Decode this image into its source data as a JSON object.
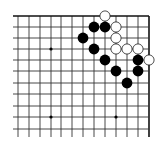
{
  "board": {
    "size": 19,
    "view": "top-right corner",
    "visible_columns": 13,
    "visible_rows": 11,
    "colors": {
      "background": "#ffffff",
      "line": "#333333",
      "edge_line": "#111111",
      "black_stone": "#000000",
      "white_stone": "#ffffff",
      "white_stone_outline": "#222222"
    },
    "columns_x": [
      149,
      138,
      127,
      116,
      105,
      94,
      83,
      72,
      61,
      51,
      40,
      29,
      18
    ],
    "rows_y": [
      16,
      27,
      38,
      49,
      60,
      71,
      83,
      94,
      106,
      117,
      129
    ],
    "star_points": [
      {
        "col": 3,
        "row": 3
      },
      {
        "col": 9,
        "row": 3
      },
      {
        "col": 3,
        "row": 9
      },
      {
        "col": 9,
        "row": 9
      }
    ],
    "stones": [
      {
        "color": "white",
        "col": 4,
        "row": 0
      },
      {
        "color": "black",
        "col": 5,
        "row": 1
      },
      {
        "color": "black",
        "col": 4,
        "row": 1
      },
      {
        "color": "white",
        "col": 3,
        "row": 1
      },
      {
        "color": "black",
        "col": 6,
        "row": 2
      },
      {
        "color": "white",
        "col": 3,
        "row": 2
      },
      {
        "color": "black",
        "col": 5,
        "row": 3
      },
      {
        "color": "white",
        "col": 3,
        "row": 3
      },
      {
        "color": "white",
        "col": 2,
        "row": 3
      },
      {
        "color": "white",
        "col": 1,
        "row": 3
      },
      {
        "color": "black",
        "col": 4,
        "row": 4
      },
      {
        "color": "black",
        "col": 1,
        "row": 4
      },
      {
        "color": "white",
        "col": 0,
        "row": 4
      },
      {
        "color": "black",
        "col": 3,
        "row": 5
      },
      {
        "color": "black",
        "col": 1,
        "row": 5
      },
      {
        "color": "black",
        "col": 2,
        "row": 6
      }
    ]
  }
}
